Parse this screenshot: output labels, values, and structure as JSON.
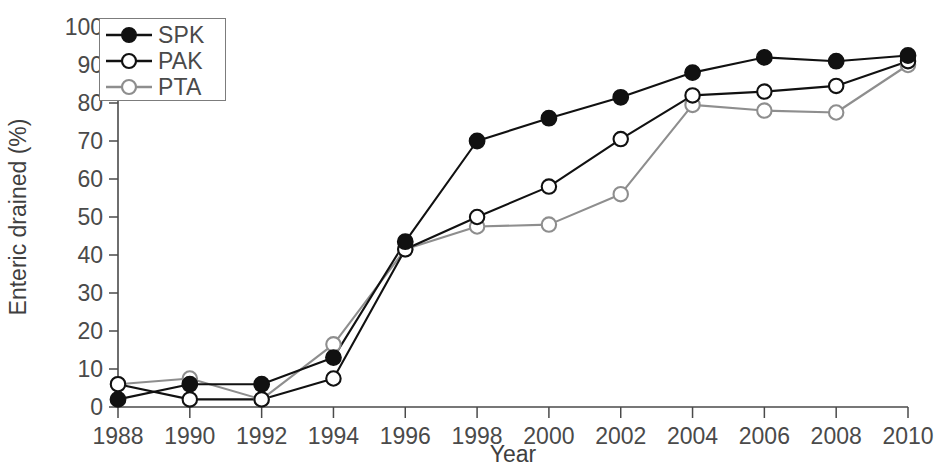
{
  "chart_data": {
    "type": "line",
    "title": "",
    "subtitle": "",
    "xlabel": "Year",
    "ylabel": "Enteric drained (%)",
    "xlim": [
      1988,
      2010
    ],
    "ylim": [
      0,
      100
    ],
    "grid": false,
    "legend_position": "top-left",
    "x": [
      1988,
      1990,
      1992,
      1994,
      1996,
      1998,
      2000,
      2002,
      2004,
      2006,
      2008,
      2010
    ],
    "xtick_labels": [
      "1988",
      "1990",
      "1992",
      "1994",
      "1996",
      "1998",
      "2000",
      "2002",
      "2004",
      "2006",
      "2008",
      "2010"
    ],
    "ytick_labels": [
      "0",
      "10",
      "20",
      "30",
      "40",
      "50",
      "60",
      "70",
      "80",
      "90",
      "100"
    ],
    "ytick_values": [
      0,
      10,
      20,
      30,
      40,
      50,
      60,
      70,
      80,
      90,
      100
    ],
    "series": [
      {
        "name": "SPK",
        "color": "#111111",
        "marker": "filled-circle",
        "values": [
          2,
          6,
          6,
          13,
          43.5,
          70,
          76,
          81.5,
          88,
          92,
          91,
          92.5
        ]
      },
      {
        "name": "PAK",
        "color": "#111111",
        "marker": "open-circle",
        "values": [
          6,
          2,
          2,
          7.5,
          41.5,
          50,
          58,
          70.5,
          82,
          83,
          84.5,
          91
        ]
      },
      {
        "name": "PTA",
        "color": "#8e8e8e",
        "marker": "open-circle",
        "values": [
          6,
          7.5,
          2,
          16.5,
          41.5,
          47.5,
          48,
          56,
          79.5,
          78,
          77.5,
          90
        ]
      }
    ]
  },
  "legend": {
    "entries": [
      {
        "label": "SPK"
      },
      {
        "label": "PAK"
      },
      {
        "label": "PTA"
      }
    ]
  },
  "axes": {
    "x_title": "Year",
    "y_title": "Enteric drained (%)"
  }
}
